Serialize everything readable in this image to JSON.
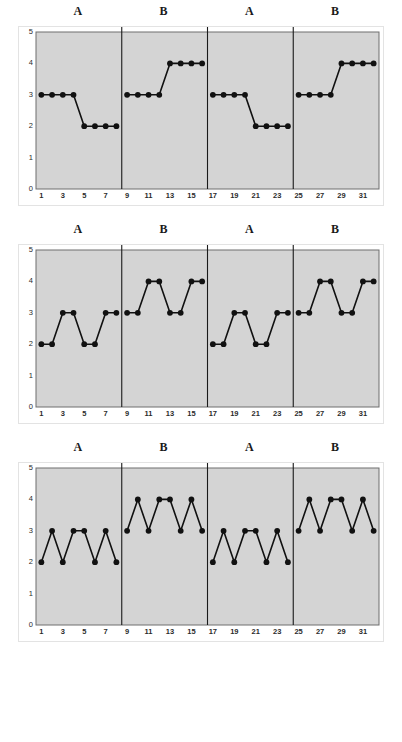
{
  "figure": {
    "panel_count": 3,
    "phase_labels": [
      "A",
      "B",
      "A",
      "B"
    ],
    "y_ticks": [
      "0",
      "1",
      "2",
      "3",
      "4",
      "5"
    ],
    "x_ticks": [
      "1",
      "3",
      "5",
      "7",
      "9",
      "11",
      "13",
      "15",
      "17",
      "19",
      "21",
      "23",
      "25",
      "27",
      "29",
      "31"
    ],
    "colors": {
      "plot_background": "#d4d4d4",
      "plot_border": "#6e6e6e",
      "phase_divider": "#1a1a1a",
      "data_line": "#111111",
      "marker": "#111111",
      "outer_frame": "#e3e3e3",
      "tick_text": "#2b2b2b"
    }
  },
  "chart_data": [
    {
      "type": "line",
      "title": "",
      "xlabel": "",
      "ylabel": "",
      "xlim": [
        0.5,
        32.5
      ],
      "ylim": [
        0,
        5
      ],
      "grid": false,
      "legend": "none",
      "phase_dividers_after_x": [
        8,
        16,
        24
      ],
      "phases": [
        {
          "label": "A",
          "x_start": 1,
          "x_end": 8
        },
        {
          "label": "B",
          "x_start": 9,
          "x_end": 16
        },
        {
          "label": "A",
          "x_start": 17,
          "x_end": 24
        },
        {
          "label": "B",
          "x_start": 25,
          "x_end": 32
        }
      ],
      "x": [
        1,
        2,
        3,
        4,
        5,
        6,
        7,
        8,
        9,
        10,
        11,
        12,
        13,
        14,
        15,
        16,
        17,
        18,
        19,
        20,
        21,
        22,
        23,
        24,
        25,
        26,
        27,
        28,
        29,
        30,
        31,
        32
      ],
      "series": [
        {
          "name": "panel-1",
          "segments": [
            {
              "phase": "A",
              "x": [
                1,
                2,
                3,
                4,
                5,
                6,
                7,
                8
              ],
              "values": [
                3,
                3,
                3,
                3,
                2,
                2,
                2,
                2
              ]
            },
            {
              "phase": "B",
              "x": [
                9,
                10,
                11,
                12,
                13,
                14,
                15,
                16
              ],
              "values": [
                3,
                3,
                3,
                3,
                4,
                4,
                4,
                4
              ]
            },
            {
              "phase": "A",
              "x": [
                17,
                18,
                19,
                20,
                21,
                22,
                23,
                24
              ],
              "values": [
                3,
                3,
                3,
                3,
                2,
                2,
                2,
                2
              ]
            },
            {
              "phase": "B",
              "x": [
                25,
                26,
                27,
                28,
                29,
                30,
                31,
                32
              ],
              "values": [
                3,
                3,
                3,
                3,
                4,
                4,
                4,
                4
              ]
            }
          ]
        }
      ]
    },
    {
      "type": "line",
      "title": "",
      "xlabel": "",
      "ylabel": "",
      "xlim": [
        0.5,
        32.5
      ],
      "ylim": [
        0,
        5
      ],
      "grid": false,
      "legend": "none",
      "phase_dividers_after_x": [
        8,
        16,
        24
      ],
      "phases": [
        {
          "label": "A",
          "x_start": 1,
          "x_end": 8
        },
        {
          "label": "B",
          "x_start": 9,
          "x_end": 16
        },
        {
          "label": "A",
          "x_start": 17,
          "x_end": 24
        },
        {
          "label": "B",
          "x_start": 25,
          "x_end": 32
        }
      ],
      "x": [
        1,
        2,
        3,
        4,
        5,
        6,
        7,
        8,
        9,
        10,
        11,
        12,
        13,
        14,
        15,
        16,
        17,
        18,
        19,
        20,
        21,
        22,
        23,
        24,
        25,
        26,
        27,
        28,
        29,
        30,
        31,
        32
      ],
      "series": [
        {
          "name": "panel-2",
          "segments": [
            {
              "phase": "A",
              "x": [
                1,
                2,
                3,
                4,
                5,
                6,
                7,
                8
              ],
              "values": [
                2,
                2,
                3,
                3,
                2,
                2,
                3,
                3
              ]
            },
            {
              "phase": "B",
              "x": [
                9,
                10,
                11,
                12,
                13,
                14,
                15,
                16
              ],
              "values": [
                3,
                3,
                4,
                4,
                3,
                3,
                4,
                4
              ]
            },
            {
              "phase": "A",
              "x": [
                17,
                18,
                19,
                20,
                21,
                22,
                23,
                24
              ],
              "values": [
                2,
                2,
                3,
                3,
                2,
                2,
                3,
                3
              ]
            },
            {
              "phase": "B",
              "x": [
                25,
                26,
                27,
                28,
                29,
                30,
                31,
                32
              ],
              "values": [
                3,
                3,
                4,
                4,
                3,
                3,
                4,
                4
              ]
            }
          ]
        }
      ]
    },
    {
      "type": "line",
      "title": "",
      "xlabel": "",
      "ylabel": "",
      "xlim": [
        0.5,
        32.5
      ],
      "ylim": [
        0,
        5
      ],
      "grid": false,
      "legend": "none",
      "phase_dividers_after_x": [
        8,
        16,
        24
      ],
      "phases": [
        {
          "label": "A",
          "x_start": 1,
          "x_end": 8
        },
        {
          "label": "B",
          "x_start": 9,
          "x_end": 16
        },
        {
          "label": "A",
          "x_start": 17,
          "x_end": 24
        },
        {
          "label": "B",
          "x_start": 25,
          "x_end": 32
        }
      ],
      "x": [
        1,
        2,
        3,
        4,
        5,
        6,
        7,
        8,
        9,
        10,
        11,
        12,
        13,
        14,
        15,
        16,
        17,
        18,
        19,
        20,
        21,
        22,
        23,
        24,
        25,
        26,
        27,
        28,
        29,
        30,
        31,
        32
      ],
      "series": [
        {
          "name": "panel-3",
          "segments": [
            {
              "phase": "A",
              "x": [
                1,
                2,
                3,
                4,
                5,
                6,
                7,
                8
              ],
              "values": [
                2,
                3,
                2,
                3,
                3,
                2,
                3,
                2
              ]
            },
            {
              "phase": "B",
              "x": [
                9,
                10,
                11,
                12,
                13,
                14,
                15,
                16
              ],
              "values": [
                3,
                4,
                3,
                4,
                4,
                3,
                4,
                3
              ]
            },
            {
              "phase": "A",
              "x": [
                17,
                18,
                19,
                20,
                21,
                22,
                23,
                24
              ],
              "values": [
                2,
                3,
                2,
                3,
                3,
                2,
                3,
                2
              ]
            },
            {
              "phase": "B",
              "x": [
                25,
                26,
                27,
                28,
                29,
                30,
                31,
                32
              ],
              "values": [
                3,
                4,
                3,
                4,
                4,
                3,
                4,
                3
              ]
            }
          ]
        }
      ]
    }
  ]
}
